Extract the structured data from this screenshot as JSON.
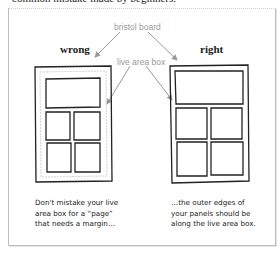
{
  "intro_text": "common mistake made by beginners.",
  "labels": {
    "bristol_board": "bristol board",
    "live_area_box": "live area box",
    "wrong": "wrong",
    "right": "right"
  },
  "captions": {
    "wrong": [
      "Don't mistake your live",
      "area box for a “page”",
      "that needs a margin…"
    ],
    "right": [
      "…the outer edges of",
      "your panels should be",
      "along the live area box."
    ]
  },
  "colors": {
    "ink": "#222222",
    "annotation_gray": "#9a9a9a",
    "frame_border": "#bdbdbd"
  }
}
